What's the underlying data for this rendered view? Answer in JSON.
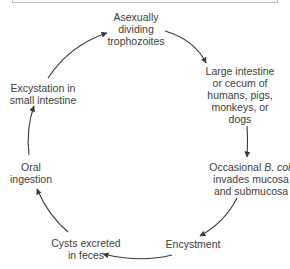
{
  "diagram": {
    "type": "life-cycle",
    "nodes": [
      {
        "id": "trophozoites",
        "lines": [
          "Asexually",
          "dividing",
          "trophozoites"
        ]
      },
      {
        "id": "large-intestine",
        "lines": [
          "Large intestine",
          "or cecum of",
          "humans, pigs,",
          "monkeys, or",
          "dogs"
        ]
      },
      {
        "id": "invasion",
        "lines_pre": "Occasional ",
        "lines_italic": "B. coli",
        "lines": [
          "invades mucosa",
          "and submucosa"
        ]
      },
      {
        "id": "encystment",
        "lines": [
          "Encystment"
        ]
      },
      {
        "id": "cysts-excreted",
        "lines": [
          "Cysts excreted",
          "in feces"
        ]
      },
      {
        "id": "oral-ingestion",
        "lines": [
          "Oral",
          "ingestion"
        ]
      },
      {
        "id": "excystation",
        "lines": [
          "Excystation in",
          "small intestine"
        ]
      }
    ],
    "edges": [
      {
        "from": "trophozoites",
        "to": "large-intestine"
      },
      {
        "from": "large-intestine",
        "to": "invasion"
      },
      {
        "from": "invasion",
        "to": "encystment"
      },
      {
        "from": "encystment",
        "to": "cysts-excreted"
      },
      {
        "from": "cysts-excreted",
        "to": "oral-ingestion"
      },
      {
        "from": "oral-ingestion",
        "to": "excystation"
      },
      {
        "from": "excystation",
        "to": "trophozoites"
      }
    ],
    "colors": {
      "arrow": "#3a3a3a",
      "text": "#3d3d3d",
      "box_border": "#bdbdbd"
    }
  }
}
